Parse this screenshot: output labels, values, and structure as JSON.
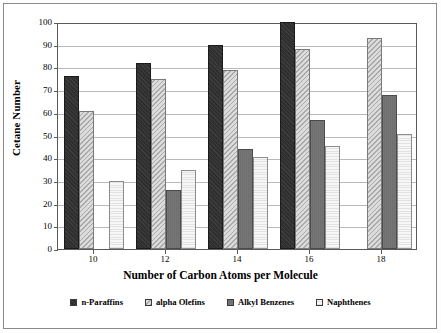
{
  "chart_data": {
    "type": "bar",
    "title": "",
    "subtitle": "",
    "xlabel": "Number of Carbon Atoms per Molecule",
    "ylabel": "Cetane Number",
    "categories": [
      "10",
      "12",
      "14",
      "16",
      "18"
    ],
    "ylim": [
      0,
      100
    ],
    "yticks": [
      0,
      10,
      20,
      30,
      40,
      50,
      60,
      70,
      80,
      90,
      100
    ],
    "grid": "horizontal",
    "legend_position": "bottom",
    "series": [
      {
        "name": "n-Paraffins",
        "color": "#2f2f2f",
        "pattern": "solid-dark",
        "values": [
          76,
          82,
          90,
          100,
          null
        ]
      },
      {
        "name": "alpha Olefins",
        "color": "#c9c9c9",
        "pattern": "diagonal-hatch-light",
        "values": [
          61,
          75,
          79,
          88,
          93
        ]
      },
      {
        "name": "Alkyl Benzenes",
        "color": "#6f6f6f",
        "pattern": "solid-gray",
        "values": [
          null,
          26,
          44,
          57,
          68
        ]
      },
      {
        "name": "Naphthenes",
        "color": "#efefef",
        "pattern": "dotted-very-light",
        "values": [
          30,
          35,
          40.5,
          45.5,
          50.5
        ]
      }
    ]
  },
  "axes": {
    "y_title": "Cetane Number",
    "x_title": "Number of Carbon Atoms per Molecule",
    "y_tick_labels": [
      "100",
      "90",
      "80",
      "70",
      "60",
      "50",
      "40",
      "30",
      "20",
      "10",
      "0"
    ],
    "x_tick_labels": [
      "10",
      "12",
      "14",
      "16",
      "18"
    ]
  },
  "legend": {
    "items": [
      {
        "label": "n-Paraffins"
      },
      {
        "label": "alpha Olefins"
      },
      {
        "label": "Alkyl Benzenes"
      },
      {
        "label": "Naphthenes"
      }
    ]
  }
}
